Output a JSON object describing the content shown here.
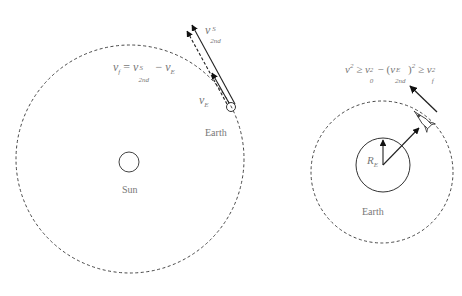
{
  "left_panel": {
    "sun_label": "Sun",
    "earth_label": "Earth",
    "equation": {
      "lhs": "v",
      "lhs_sub": "f",
      "eq": " = ",
      "v": "v",
      "v_sup": "S",
      "v_sub": "2nd",
      "minus": " − ",
      "ve": "v",
      "ve_sub": "E"
    },
    "v2nd_label": {
      "base": "v",
      "sup": "S",
      "sub": "2nd"
    },
    "ve_label": {
      "base": "v",
      "sub": "E"
    }
  },
  "right_panel": {
    "earth_label": "Earth",
    "radius_label": {
      "base": "R",
      "sub": "E"
    },
    "inequality": {
      "a": "v",
      "a_sup": "2",
      "ge1": " ≥ ",
      "b": "v",
      "b_sub": "0",
      "b_sup": "2",
      "minus": " − (",
      "c": "v",
      "c_sup": "E",
      "c_sub": "2nd",
      "close": ")",
      "c2": "2",
      "ge2": " ≥ ",
      "d": "v",
      "d_sub": "f",
      "d_sup": "2"
    }
  },
  "colors": {
    "stroke": "#222222",
    "text": "#777777",
    "dash": "#333333"
  }
}
